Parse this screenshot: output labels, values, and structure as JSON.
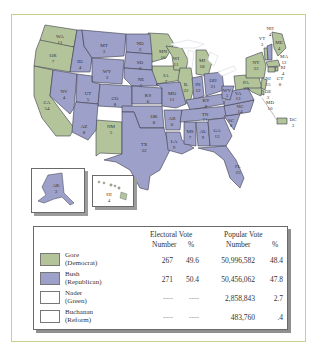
{
  "colors": {
    "democrat": "#b3c49a",
    "republican": "#9da0c8",
    "none": "#ffffff",
    "frame_border": "#c9cf8a",
    "water": "#ffffff"
  },
  "map": {
    "states": [
      {
        "abbr": "WA",
        "votes": "11",
        "party": "democrat"
      },
      {
        "abbr": "OR",
        "votes": "7",
        "party": "democrat"
      },
      {
        "abbr": "CA",
        "votes": "54",
        "party": "democrat"
      },
      {
        "abbr": "ID",
        "votes": "4",
        "party": "republican"
      },
      {
        "abbr": "NV",
        "votes": "4",
        "party": "republican"
      },
      {
        "abbr": "MT",
        "votes": "3",
        "party": "republican"
      },
      {
        "abbr": "WY",
        "votes": "3",
        "party": "republican"
      },
      {
        "abbr": "UT",
        "votes": "5",
        "party": "republican"
      },
      {
        "abbr": "AZ",
        "votes": "8",
        "party": "republican"
      },
      {
        "abbr": "CO",
        "votes": "8",
        "party": "republican"
      },
      {
        "abbr": "NM",
        "votes": "5",
        "party": "democrat"
      },
      {
        "abbr": "ND",
        "votes": "3",
        "party": "republican"
      },
      {
        "abbr": "SD",
        "votes": "3",
        "party": "republican"
      },
      {
        "abbr": "NE",
        "votes": "5",
        "party": "republican"
      },
      {
        "abbr": "KS",
        "votes": "6",
        "party": "republican"
      },
      {
        "abbr": "OK",
        "votes": "8",
        "party": "republican"
      },
      {
        "abbr": "TX",
        "votes": "32",
        "party": "republican"
      },
      {
        "abbr": "MN",
        "votes": "10",
        "party": "democrat"
      },
      {
        "abbr": "IA",
        "votes": "7",
        "party": "democrat"
      },
      {
        "abbr": "MO",
        "votes": "11",
        "party": "republican"
      },
      {
        "abbr": "AR",
        "votes": "6",
        "party": "republican"
      },
      {
        "abbr": "LA",
        "votes": "9",
        "party": "republican"
      },
      {
        "abbr": "WI",
        "votes": "11",
        "party": "democrat"
      },
      {
        "abbr": "IL",
        "votes": "22",
        "party": "democrat"
      },
      {
        "abbr": "MI",
        "votes": "18",
        "party": "democrat"
      },
      {
        "abbr": "IN",
        "votes": "12",
        "party": "republican"
      },
      {
        "abbr": "OH",
        "votes": "21",
        "party": "republican"
      },
      {
        "abbr": "KY",
        "votes": "8",
        "party": "republican"
      },
      {
        "abbr": "TN",
        "votes": "11",
        "party": "republican"
      },
      {
        "abbr": "MS",
        "votes": "7",
        "party": "republican"
      },
      {
        "abbr": "AL",
        "votes": "9",
        "party": "republican"
      },
      {
        "abbr": "GA",
        "votes": "13",
        "party": "republican"
      },
      {
        "abbr": "FL",
        "votes": "25",
        "party": "republican"
      },
      {
        "abbr": "SC",
        "votes": "8",
        "party": "republican"
      },
      {
        "abbr": "NC",
        "votes": "14",
        "party": "republican"
      },
      {
        "abbr": "VA",
        "votes": "13",
        "party": "republican"
      },
      {
        "abbr": "WV",
        "votes": "5",
        "party": "republican"
      },
      {
        "abbr": "PA",
        "votes": "23",
        "party": "democrat"
      },
      {
        "abbr": "NY",
        "votes": "33",
        "party": "democrat"
      },
      {
        "abbr": "VT",
        "votes": "3",
        "party": "democrat"
      },
      {
        "abbr": "NH",
        "votes": "4",
        "party": "republican"
      },
      {
        "abbr": "ME",
        "votes": "4",
        "party": "democrat"
      },
      {
        "abbr": "MA",
        "votes": "12",
        "party": "democrat"
      },
      {
        "abbr": "RI",
        "votes": "4",
        "party": "democrat"
      },
      {
        "abbr": "CT",
        "votes": "8",
        "party": "democrat"
      },
      {
        "abbr": "NJ",
        "votes": "15",
        "party": "democrat"
      },
      {
        "abbr": "DE",
        "votes": "3",
        "party": "democrat"
      },
      {
        "abbr": "MD",
        "votes": "10",
        "party": "democrat"
      },
      {
        "abbr": "DC",
        "votes": "3",
        "party": "democrat"
      },
      {
        "abbr": "AK",
        "votes": "3",
        "party": "republican"
      },
      {
        "abbr": "HI",
        "votes": "4",
        "party": "democrat"
      }
    ]
  },
  "table": {
    "group_headers": {
      "electoral": "Electoral Vote",
      "popular": "Popular Vote"
    },
    "sub_headers": {
      "ev_number": "Number",
      "ev_pct": "%",
      "pv_number": "Number",
      "pv_pct": "%"
    },
    "rows": [
      {
        "name": "Gore",
        "party": "(Democrat)",
        "swatch": "#b3c49a",
        "ev_number": "267",
        "ev_pct": "49.6",
        "pv_number": "50,996,582",
        "pv_pct": "48.4"
      },
      {
        "name": "Bush",
        "party": "(Republican)",
        "swatch": "#9da0c8",
        "ev_number": "271",
        "ev_pct": "50.4",
        "pv_number": "50,456,062",
        "pv_pct": "47.8"
      },
      {
        "name": "Nader",
        "party": "(Green)",
        "swatch": "#ffffff",
        "ev_number": "----",
        "ev_pct": "----",
        "pv_number": "2,858,843",
        "pv_pct": "2.7"
      },
      {
        "name": "Buchanan",
        "party": "(Reform)",
        "swatch": "#ffffff",
        "ev_number": "----",
        "ev_pct": "----",
        "pv_number": "483,760",
        "pv_pct": ".4"
      }
    ]
  }
}
